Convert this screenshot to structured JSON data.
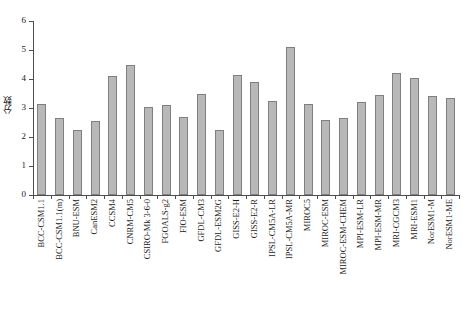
{
  "chart_data": {
    "type": "bar",
    "title": "",
    "xlabel": "",
    "ylabel": "分数",
    "ylim": [
      0,
      6
    ],
    "yticks": [
      0,
      1,
      2,
      3,
      4,
      5,
      6
    ],
    "grid": false,
    "legend": "none",
    "bar_color": "#b8b8b8",
    "bar_edge_color": "#808080",
    "axis_color": "#4d4d4d",
    "categories": [
      "BCC-CSM1.1",
      "BCC-CSM1.1(m)",
      "BNU-ESM",
      "CanESM2",
      "CCSM4",
      "CNRM-CM5",
      "CSIRO-Mk 3-6-0",
      "FGOALS-g2",
      "FIO-ESM",
      "GFDL-CM3",
      "GFDL-ESM2G",
      "GISS-E2-H",
      "GISS-E2-R",
      "IPSL-CM5A-LR",
      "IPSL-CM5A-MR",
      "MIROC5",
      "MIROC-ESM",
      "MIROC-ESM-CHEM",
      "MPI-ESM-LR",
      "MPI-ESM-MR",
      "MRI-CGCM3",
      "MRI-ESM1",
      "NorESM1-M",
      "NorESM1-ME"
    ],
    "values": [
      3.15,
      2.65,
      2.25,
      2.55,
      4.1,
      4.5,
      3.05,
      3.1,
      2.7,
      3.5,
      2.25,
      4.15,
      3.9,
      3.25,
      5.1,
      3.15,
      2.6,
      2.65,
      3.2,
      3.45,
      4.2,
      4.05,
      3.4,
      3.35
    ]
  }
}
